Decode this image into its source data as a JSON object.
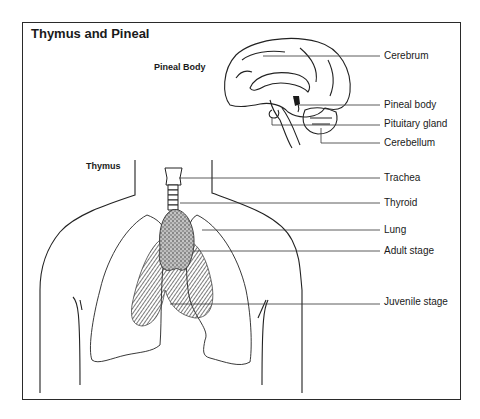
{
  "figure": {
    "title": "Thymus and Pineal",
    "sections": {
      "pineal": "Pineal Body",
      "thymus": "Thymus"
    },
    "labels": [
      {
        "text": "Cerebrum",
        "x": 384,
        "y": 50
      },
      {
        "text": "Pineal body",
        "x": 384,
        "y": 99
      },
      {
        "text": "Pituitary gland",
        "x": 384,
        "y": 118
      },
      {
        "text": "Cerebellum",
        "x": 384,
        "y": 137
      },
      {
        "text": "Trachea",
        "x": 384,
        "y": 172
      },
      {
        "text": "Thyroid",
        "x": 384,
        "y": 197
      },
      {
        "text": "Lung",
        "x": 384,
        "y": 224
      },
      {
        "text": "Adult stage",
        "x": 384,
        "y": 245
      },
      {
        "text": "Juvenile stage",
        "x": 384,
        "y": 296
      }
    ]
  }
}
